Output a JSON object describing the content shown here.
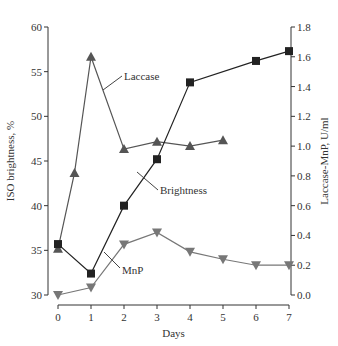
{
  "chart_data": {
    "type": "line",
    "title": "",
    "xlabel": "Days",
    "ylabel": "ISO brightness, %",
    "y2label": "Laccase-MnP, U/ml",
    "xlim": [
      0,
      7
    ],
    "ylim": [
      30,
      60
    ],
    "y2lim": [
      0.0,
      1.8
    ],
    "x_ticks": [
      "0",
      "1",
      "2",
      "3",
      "4",
      "5",
      "6",
      "7"
    ],
    "y_ticks": [
      "30",
      "35",
      "40",
      "45",
      "50",
      "55",
      "60"
    ],
    "y2_ticks": [
      "0.0",
      "0.2",
      "0.4",
      "0.6",
      "0.8",
      "1.0",
      "1.2",
      "1.4",
      "1.6",
      "1.8"
    ],
    "grid": false,
    "legend_position": "inline labels",
    "series": [
      {
        "name": "Brightness",
        "axis": "left",
        "marker": "square",
        "color": "#222222",
        "x": [
          0,
          1,
          2,
          3,
          4,
          6,
          7
        ],
        "values": [
          35.7,
          32.4,
          40.0,
          45.2,
          53.8,
          56.2,
          57.3
        ]
      },
      {
        "name": "Laccase",
        "axis": "right",
        "marker": "triangle-up",
        "color": "#555555",
        "x": [
          0,
          0.5,
          1,
          2,
          3,
          4,
          5
        ],
        "values": [
          0.31,
          0.82,
          1.6,
          0.98,
          1.03,
          1.0,
          1.04
        ]
      },
      {
        "name": "MnP",
        "axis": "right",
        "marker": "triangle-down",
        "color": "#777777",
        "x": [
          0,
          1,
          2,
          3,
          4,
          5,
          6,
          7
        ],
        "values": [
          0.0,
          0.05,
          0.34,
          0.42,
          0.29,
          0.24,
          0.2,
          0.2
        ]
      }
    ],
    "annotations": [
      {
        "text": "Laccase",
        "x_px": 124,
        "y_px": 80
      },
      {
        "text": "Brightness",
        "x_px": 160,
        "y_px": 194
      },
      {
        "text": "MnP",
        "x_px": 122,
        "y_px": 274
      }
    ]
  }
}
